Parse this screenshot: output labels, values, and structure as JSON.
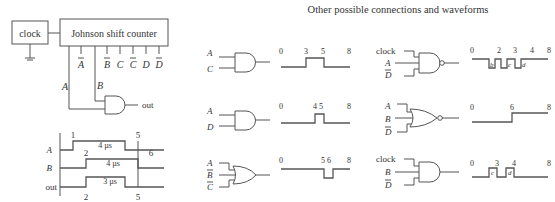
{
  "main_circuit": {
    "clock_label": "clock",
    "counter_label": "Johnson shift counter",
    "counter_outputs": [
      {
        "name": "A",
        "inverted": false,
        "shown": false
      },
      {
        "name": "A",
        "inverted": true,
        "shown": true
      },
      {
        "name": "B",
        "inverted": false,
        "shown": false
      },
      {
        "name": "B",
        "inverted": true,
        "shown": true
      },
      {
        "name": "C",
        "inverted": false,
        "shown": true
      },
      {
        "name": "C",
        "inverted": true,
        "shown": true
      },
      {
        "name": "D",
        "inverted": false,
        "shown": true
      },
      {
        "name": "D",
        "inverted": true,
        "shown": true
      }
    ],
    "wire_labels": {
      "a": "A",
      "b": "B"
    },
    "gate_type": "AND",
    "output_label": "out"
  },
  "timing": {
    "signals": [
      {
        "name": "A",
        "rise": 1,
        "fall": 5,
        "width_label": "4 µs",
        "rise_label": "1",
        "fall_label": "5"
      },
      {
        "name": "B",
        "rise": 2,
        "fall": 6,
        "width_label": "4 µs",
        "rise_label": "2",
        "fall_label": "6"
      },
      {
        "name": "out",
        "rise": 2,
        "fall": 5,
        "width_label": "3 µs",
        "rise_label": "2",
        "fall_label": "5"
      }
    ]
  },
  "other": {
    "title": "Other possible connections and waveforms",
    "examples": [
      {
        "gate": "AND",
        "inputs": [
          {
            "n": "A",
            "inv": false
          },
          {
            "n": "C",
            "inv": false
          }
        ],
        "ticks": [
          "0",
          "3",
          "5",
          "8"
        ],
        "wave": "pulse high 3-5"
      },
      {
        "gate": "AND",
        "inputs": [
          {
            "n": "A",
            "inv": false
          },
          {
            "n": "D",
            "inv": false
          }
        ],
        "ticks": [
          "0",
          "4 5",
          "8"
        ],
        "wave": "pulse high 4-5"
      },
      {
        "gate": "OR",
        "inputs": [
          {
            "n": "A",
            "inv": false
          },
          {
            "n": "B",
            "inv": true
          },
          {
            "n": "C",
            "inv": true
          }
        ],
        "ticks": [
          "0",
          "5 6",
          "8"
        ],
        "wave": "pulse low 5-6"
      },
      {
        "gate": "NAND",
        "inputs": [
          {
            "n": "clock",
            "inv": false
          },
          {
            "n": "A",
            "inv": false
          },
          {
            "n": "D",
            "inv": true
          }
        ],
        "ticks": [
          "0",
          "2",
          "3",
          "4",
          "8"
        ],
        "pulse_labels": [
          "b",
          "c",
          "d"
        ],
        "wave": "low pulses b, c, d"
      },
      {
        "gate": "NOR",
        "inputs": [
          {
            "n": "A",
            "inv": false
          },
          {
            "n": "B",
            "inv": false
          },
          {
            "n": "D",
            "inv": true
          }
        ],
        "ticks": [
          "0",
          "6",
          "8"
        ],
        "wave": "step high at 6"
      },
      {
        "gate": "AND",
        "inputs": [
          {
            "n": "clock",
            "inv": false
          },
          {
            "n": "B",
            "inv": false
          },
          {
            "n": "D",
            "inv": true
          }
        ],
        "ticks": [
          "0",
          "3",
          "4",
          "8"
        ],
        "pulse_labels": [
          "c",
          "d"
        ],
        "wave": "high pulses c, d"
      }
    ]
  }
}
